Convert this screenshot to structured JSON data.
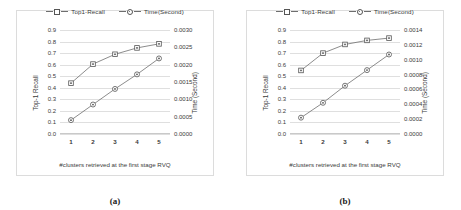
{
  "figure": {
    "panels": [
      {
        "caption": "(a)",
        "legend": [
          {
            "label": "Top1-Recall",
            "marker": "square-marker-icon"
          },
          {
            "label": "Time(Second)",
            "marker": "circle-marker-icon"
          }
        ],
        "chart_data": {
          "type": "line",
          "title": "",
          "xlabel": "#clusters retrieved at the first stage RVQ",
          "ylabel": "Top-1 Recall",
          "y2label": "Time (Second)",
          "categories": [
            "1",
            "2",
            "3",
            "4",
            "5"
          ],
          "x": [
            1,
            2,
            3,
            4,
            5
          ],
          "ylim": [
            0.0,
            0.9
          ],
          "yticks": [
            "0.0",
            "0.1",
            "0.2",
            "0.3",
            "0.4",
            "0.5",
            "0.6",
            "0.7",
            "0.8",
            "0.9"
          ],
          "y2lim": [
            0.0,
            0.003
          ],
          "y2ticks": [
            "0.0000",
            "0.0005",
            "0.0010",
            "0.0015",
            "0.0020",
            "0.0025",
            "0.0030"
          ],
          "grid": true,
          "legend_position": "top-center",
          "series": [
            {
              "name": "Top1-Recall",
              "axis": "left",
              "marker": "square",
              "values": [
                0.44,
                0.605,
                0.69,
                0.745,
                0.78
              ]
            },
            {
              "name": "Time(Second)",
              "axis": "right",
              "marker": "circle",
              "values": [
                0.0004,
                0.00085,
                0.0013,
                0.00172,
                0.00218
              ]
            }
          ]
        }
      },
      {
        "caption": "(b)",
        "legend": [
          {
            "label": "Top1-Recall",
            "marker": "square-marker-icon"
          },
          {
            "label": "Time(Second)",
            "marker": "circle-marker-icon"
          }
        ],
        "chart_data": {
          "type": "line",
          "title": "",
          "xlabel": "#clusters retrieved at the first stage RVQ",
          "ylabel": "Top-1 Recall",
          "y2label": "Time (Second)",
          "categories": [
            "1",
            "2",
            "3",
            "4",
            "5"
          ],
          "x": [
            1,
            2,
            3,
            4,
            5
          ],
          "ylim": [
            0.0,
            0.9
          ],
          "yticks": [
            "0.0",
            "0.1",
            "0.2",
            "0.3",
            "0.4",
            "0.5",
            "0.6",
            "0.7",
            "0.8",
            "0.9"
          ],
          "y2lim": [
            0.0,
            0.0014
          ],
          "y2ticks": [
            "0.0000",
            "0.0002",
            "0.0004",
            "0.0006",
            "0.0008",
            "0.0010",
            "0.0012",
            "0.0014"
          ],
          "grid": true,
          "legend_position": "top-center",
          "series": [
            {
              "name": "Top1-Recall",
              "axis": "left",
              "marker": "square",
              "values": [
                0.55,
                0.7,
                0.775,
                0.81,
                0.83
              ]
            },
            {
              "name": "Time(Second)",
              "axis": "right",
              "marker": "circle",
              "values": [
                0.00022,
                0.00042,
                0.00065,
                0.00086,
                0.00107
              ]
            }
          ]
        }
      }
    ]
  },
  "colors": {
    "line": "#6e6e6e",
    "marker_stroke": "#555555",
    "grid": "#dfdfdf",
    "text": "#3a3a3a",
    "frame": "#dcdcdc",
    "background": "#ffffff"
  }
}
